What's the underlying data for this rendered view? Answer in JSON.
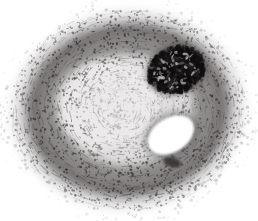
{
  "image": {
    "kind": "histology-micrograph",
    "title": "Histological cross-section micrograph",
    "description": "Grayscale stained tissue cross-section, roughly oval specimen filling the frame on a white background",
    "width": 258,
    "height": 221,
    "background_color": "#ffffff",
    "stain": "monochrome / grayscale",
    "orientation": "transverse section"
  },
  "palette": {
    "background": "#ffffff",
    "lumen_white": "#ffffff",
    "pale_core": "#eceaea",
    "light_gray": "#d8d6d6",
    "mid_gray": "#a9a6a6",
    "dark_gray": "#6f6c6c",
    "darker_gray": "#4a4747",
    "near_black": "#201e1e",
    "fiber_stroke": "#5d5a5a",
    "nucleus_dot": "#2b2929"
  },
  "specimen": {
    "outline": {
      "name": "specimen-outer-boundary",
      "center_x": 128,
      "center_y": 110,
      "radius_x": 118,
      "radius_y": 100,
      "edge_quality": "feathered, scattered cell fringe"
    },
    "layers": [
      {
        "name": "outer-fringe",
        "label": "Scattered peripheral cells",
        "tone": "#b9b6b6",
        "radius_x": 118,
        "radius_y": 100
      },
      {
        "name": "outer-dark-band",
        "label": "Dense outer fibrous band",
        "tone": "#6f6c6c",
        "radius_x": 104,
        "radius_y": 88
      },
      {
        "name": "mid-lamellar-band",
        "label": "Concentric lamellar layer",
        "tone": "#8e8b8b",
        "radius_x": 88,
        "radius_y": 74
      },
      {
        "name": "inner-pale-zone",
        "label": "Pale loose inner tissue",
        "tone": "#e6e4e4",
        "radius_x": 66,
        "radius_y": 56
      }
    ]
  },
  "features": [
    {
      "name": "dark-stained-mass",
      "label": "Densely stained dark mass",
      "position": "upper right",
      "center_x": 176,
      "center_y": 70,
      "radius_x": 29,
      "radius_y": 23,
      "rotation_deg": -20,
      "tone": "#201e1e"
    },
    {
      "name": "lumen-cavity",
      "label": "Open lumen / cavity",
      "position": "lower right of center",
      "center_x": 171,
      "center_y": 135,
      "radius_x": 25,
      "radius_y": 17,
      "rotation_deg": -32,
      "tone": "#ffffff"
    },
    {
      "name": "small-dark-fleck",
      "label": "Small dark fleck below lumen",
      "position": "below lumen",
      "center_x": 172,
      "center_y": 162,
      "radius_x": 9,
      "radius_y": 5,
      "rotation_deg": 15,
      "tone": "#2f2c2c"
    }
  ],
  "texture": {
    "fiber_count": 900,
    "nucleus_count": 1700,
    "fringe_count": 320,
    "description": "Circumferentially arranged fibers with dense punctate nuclei, heaviest at the outer and lower bands"
  }
}
